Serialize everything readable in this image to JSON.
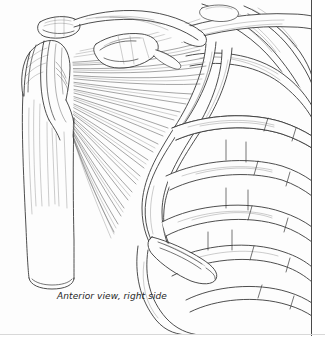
{
  "figure": {
    "caption": "Anterior view, right side",
    "background_color": "#fdfdfd",
    "line_color": "#3a3a3a",
    "border_right_color": "#4a4a4a",
    "border_bottom_color": "#d8d8d8",
    "style": "line-art pen-and-ink anatomical drawing",
    "parts": [
      {
        "name": "humerus",
        "label": "humerus shaft"
      },
      {
        "name": "humeral-head",
        "label": "head of humerus"
      },
      {
        "name": "greater-tubercle",
        "label": "greater tubercle"
      },
      {
        "name": "acromion",
        "label": "acromion"
      },
      {
        "name": "clavicle",
        "label": "clavicle"
      },
      {
        "name": "coracoid-process",
        "label": "coracoid process"
      },
      {
        "name": "pectoralis-major-fibers",
        "label": "pectoralis major muscle fibers"
      },
      {
        "name": "rib-cage",
        "label": "rib cage"
      },
      {
        "name": "costal-cartilage",
        "label": "costal cartilage"
      },
      {
        "name": "sternum",
        "label": "sternum"
      }
    ]
  }
}
